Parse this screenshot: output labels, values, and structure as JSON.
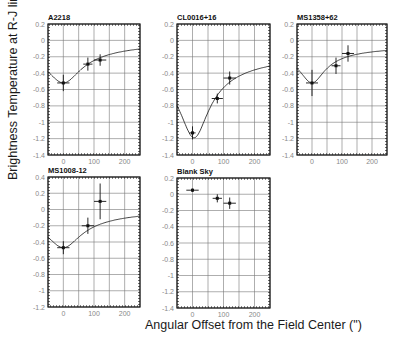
{
  "figure": {
    "ylabel": "Brightness Temperature at R-J limit (mK)",
    "xlabel": "Angular Offset from the Field Center (\")"
  },
  "chart_data": [
    {
      "type": "scatter",
      "title": "A2218",
      "xlim": [
        -50,
        250
      ],
      "ylim": [
        -1.4,
        0.2
      ],
      "xticks": [
        0,
        100,
        200
      ],
      "yticks": [
        0.2,
        0,
        -0.2,
        -0.4,
        -0.6,
        -0.8,
        -1,
        -1.2,
        -1.4
      ],
      "ytick_labels": [
        "0.2",
        "0",
        "-0.2",
        "-0.4",
        "-0.6",
        "-0.8",
        "-1",
        "-1.2",
        "-1.4"
      ],
      "grid": true,
      "points": [
        {
          "x": 0,
          "y": -0.52,
          "xerr": 20,
          "yerr": 0.1
        },
        {
          "x": 80,
          "y": -0.29,
          "xerr": 15,
          "yerr": 0.08
        },
        {
          "x": 120,
          "y": -0.24,
          "xerr": 20,
          "yerr": 0.07
        }
      ],
      "model": {
        "min": -0.52,
        "min_x": 0,
        "width": 55,
        "far": -0.06
      }
    },
    {
      "type": "scatter",
      "title": "CL0016+16",
      "xlim": [
        -50,
        250
      ],
      "ylim": [
        -1.4,
        0.2
      ],
      "xticks": [
        0,
        100,
        200
      ],
      "yticks": [
        0.2,
        0,
        -0.2,
        -0.4,
        -0.6,
        -0.8,
        -1,
        -1.2,
        -1.4
      ],
      "ytick_labels": [
        "0.2",
        "0",
        "-0.2",
        "-0.4",
        "-0.6",
        "-0.8",
        "-1",
        "-1.2",
        "-1.4"
      ],
      "grid": true,
      "points": [
        {
          "x": 0,
          "y": -1.13,
          "xerr": 10,
          "yerr": 0.08
        },
        {
          "x": 80,
          "y": -0.71,
          "xerr": 18,
          "yerr": 0.06
        },
        {
          "x": 120,
          "y": -0.46,
          "xerr": 20,
          "yerr": 0.08
        }
      ],
      "model": {
        "min": -1.19,
        "min_x": 5,
        "width": 45,
        "far": -0.26
      }
    },
    {
      "type": "scatter",
      "title": "MS1358+62",
      "xlim": [
        -50,
        250
      ],
      "ylim": [
        -1.4,
        0.2
      ],
      "xticks": [
        0,
        100,
        200
      ],
      "yticks": [
        0.2,
        0,
        -0.2,
        -0.4,
        -0.6,
        -0.8,
        -1,
        -1.2,
        -1.4
      ],
      "ytick_labels": [
        "0.2",
        "0",
        "-0.2",
        "-0.4",
        "-0.6",
        "-0.8",
        "-1",
        "-1.2",
        "-1.4"
      ],
      "grid": true,
      "points": [
        {
          "x": 0,
          "y": -0.52,
          "xerr": 20,
          "yerr": 0.16
        },
        {
          "x": 80,
          "y": -0.31,
          "xerr": 15,
          "yerr": 0.1
        },
        {
          "x": 120,
          "y": -0.16,
          "xerr": 20,
          "yerr": 0.1
        }
      ],
      "model": {
        "min": -0.52,
        "min_x": 0,
        "width": 40,
        "far": -0.11
      }
    },
    {
      "type": "scatter",
      "title": "MS1008-12",
      "xlim": [
        -50,
        250
      ],
      "ylim": [
        -1.2,
        0.4
      ],
      "xticks": [
        0,
        100,
        200
      ],
      "yticks": [
        0.4,
        0.2,
        0,
        -0.2,
        -0.4,
        -0.6,
        -0.8,
        -1,
        -1.2
      ],
      "ytick_labels": [
        "0.4",
        "0.2",
        "0",
        "-0.2",
        "-0.4",
        "-0.6",
        "-0.8",
        "-1",
        "-1.2"
      ],
      "grid": true,
      "points": [
        {
          "x": 0,
          "y": -0.47,
          "xerr": 20,
          "yerr": 0.08
        },
        {
          "x": 80,
          "y": -0.2,
          "xerr": 20,
          "yerr": 0.1
        },
        {
          "x": 120,
          "y": 0.1,
          "xerr": 20,
          "yerr": 0.22
        }
      ],
      "model": {
        "min": -0.47,
        "min_x": 0,
        "width": 55,
        "far": -0.04
      }
    },
    {
      "type": "scatter",
      "title": "Blank Sky",
      "xlim": [
        -50,
        250
      ],
      "ylim": [
        -1.4,
        0.2
      ],
      "xticks": [
        0,
        100,
        200
      ],
      "yticks": [
        0.2,
        0,
        -0.2,
        -0.4,
        -0.6,
        -0.8,
        -1,
        -1.2,
        -1.4
      ],
      "ytick_labels": [
        "0.2",
        "0",
        "-0.2",
        "-0.4",
        "-0.6",
        "-0.8",
        "-1",
        "-1.2",
        "-1.4"
      ],
      "grid": true,
      "points": [
        {
          "x": 0,
          "y": 0.05,
          "xerr": 20,
          "yerr": 0.02
        },
        {
          "x": 80,
          "y": -0.05,
          "xerr": 15,
          "yerr": 0.05
        },
        {
          "x": 120,
          "y": -0.11,
          "xerr": 20,
          "yerr": 0.07
        }
      ],
      "model": null
    }
  ],
  "layout": {
    "panels": [
      {
        "left": 48,
        "top": 24,
        "width": 92,
        "height": 131
      },
      {
        "left": 177,
        "top": 24,
        "width": 93,
        "height": 131
      },
      {
        "left": 297,
        "top": 24,
        "width": 90,
        "height": 131
      },
      {
        "left": 48,
        "top": 177,
        "width": 92,
        "height": 130
      },
      {
        "left": 177,
        "top": 178,
        "width": 93,
        "height": 130
      }
    ],
    "colors": {
      "frame": "#111111",
      "grid": "#777777",
      "data": "#111111",
      "tick_text": "#888888"
    }
  }
}
